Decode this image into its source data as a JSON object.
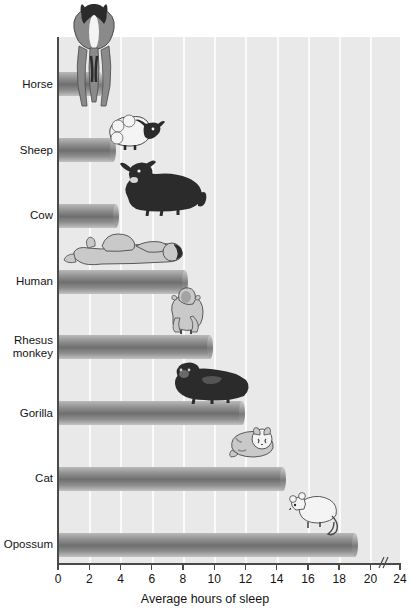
{
  "chart_data": {
    "type": "bar",
    "orientation": "horizontal",
    "title": "",
    "xlabel": "Average hours of sleep",
    "ylabel": "",
    "categories": [
      "Horse",
      "Sheep",
      "Cow",
      "Human",
      "Rhesus monkey",
      "Gorilla",
      "Cat",
      "Opossum"
    ],
    "values": [
      2.7,
      3.5,
      3.7,
      8.1,
      9.7,
      11.8,
      14.4,
      19.0
    ],
    "xlim": [
      0,
      24
    ],
    "x_ticks": [
      0,
      2,
      4,
      6,
      8,
      10,
      12,
      14,
      16,
      18,
      20,
      24
    ],
    "x_tick_labels": [
      "0",
      "2",
      "4",
      "6",
      "8",
      "10",
      "12",
      "14",
      "16",
      "18",
      "20",
      "24"
    ],
    "axis_break": {
      "present": true,
      "between": [
        20,
        24
      ],
      "symbol": "//"
    },
    "grid": "vertical-white-lines-every-2-hours",
    "legend": "none",
    "bar_color": "#7f7f7f",
    "plot_background": "#e9e9e9"
  },
  "axis": {
    "x_title": "Average hours of sleep"
  },
  "categories": [
    {
      "label": "Horse",
      "label_line1": "Horse",
      "label_line2": "",
      "value": 2.7,
      "icon": "horse-illustration"
    },
    {
      "label": "Sheep",
      "label_line1": "Sheep",
      "label_line2": "",
      "value": 3.5,
      "icon": "sheep-illustration"
    },
    {
      "label": "Cow",
      "label_line1": "Cow",
      "label_line2": "",
      "value": 3.7,
      "icon": "cow-illustration"
    },
    {
      "label": "Human",
      "label_line1": "Human",
      "label_line2": "",
      "value": 8.1,
      "icon": "human-illustration"
    },
    {
      "label": "Rhesus monkey",
      "label_line1": "Rhesus",
      "label_line2": "monkey",
      "value": 9.7,
      "icon": "monkey-illustration"
    },
    {
      "label": "Gorilla",
      "label_line1": "Gorilla",
      "label_line2": "",
      "value": 11.8,
      "icon": "gorilla-illustration"
    },
    {
      "label": "Cat",
      "label_line1": "Cat",
      "label_line2": "",
      "value": 14.4,
      "icon": "cat-illustration"
    },
    {
      "label": "Opossum",
      "label_line1": "Opossum",
      "label_line2": "",
      "value": 19.0,
      "icon": "opossum-illustration"
    }
  ],
  "ticks": [
    {
      "value": 0,
      "label": "0"
    },
    {
      "value": 2,
      "label": "2"
    },
    {
      "value": 4,
      "label": "4"
    },
    {
      "value": 6,
      "label": "6"
    },
    {
      "value": 8,
      "label": "8"
    },
    {
      "value": 10,
      "label": "10"
    },
    {
      "value": 12,
      "label": "12"
    },
    {
      "value": 14,
      "label": "14"
    },
    {
      "value": 16,
      "label": "16"
    },
    {
      "value": 18,
      "label": "18"
    },
    {
      "value": 20,
      "label": "20"
    },
    {
      "value": 24,
      "label": "24"
    }
  ],
  "colors": {
    "plot_bg": "#e9e9e9",
    "gridline": "#fbfbfb",
    "bar": "#7f7f7f",
    "axis": "#4a4a4a",
    "text": "#141414"
  }
}
